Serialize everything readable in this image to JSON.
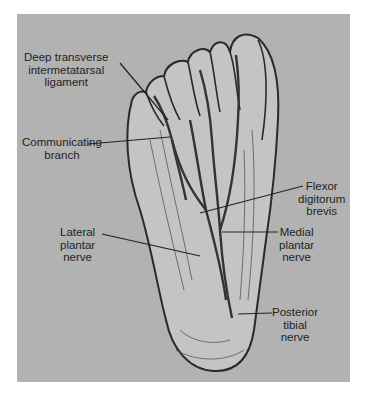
{
  "figure": {
    "background_color": "#b2b2b2",
    "ink_color": "#2a2a2a",
    "labels": [
      {
        "id": "deep-transverse",
        "text": "Deep transverse\nintermetatarsal\nligament"
      },
      {
        "id": "communicating-branch",
        "text": "Communicating\nbranch"
      },
      {
        "id": "lateral-plantar",
        "text": "Lateral\nplantar\nnerve"
      },
      {
        "id": "flexor-digitorum",
        "text": "Flexor\ndigitorum\nbrevis"
      },
      {
        "id": "medial-plantar",
        "text": "Medial\nplantar\nnerve"
      },
      {
        "id": "posterior-tibial",
        "text": "Posterior\ntibial\nnerve"
      }
    ]
  }
}
